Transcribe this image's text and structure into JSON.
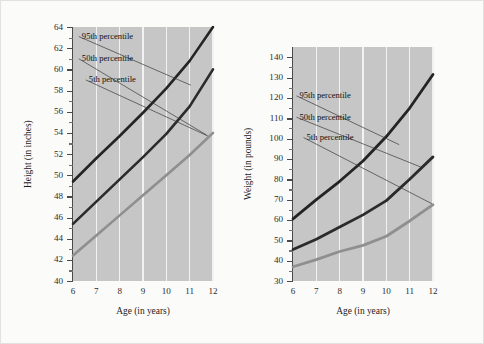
{
  "figure": {
    "background": "#fbfbfa",
    "border_color": "#e2e2e0",
    "plot_background": "#c6c6c6",
    "gridline_color": "#f2f2f2"
  },
  "chart_data": [
    {
      "id": "height",
      "type": "line",
      "title": "",
      "xlabel": "Age (in years)",
      "ylabel": "Height (in inches)",
      "x": [
        6,
        7,
        8,
        9,
        10,
        11,
        12
      ],
      "xlim": [
        6,
        12
      ],
      "ylim": [
        40,
        64
      ],
      "xticks": [
        "6",
        "7",
        "8",
        "9",
        "10",
        "11",
        "12"
      ],
      "yticks": [
        "40",
        "42",
        "44",
        "46",
        "48",
        "50",
        "52",
        "54",
        "56",
        "58",
        "60",
        "62",
        "64"
      ],
      "ytick_step": 2,
      "grid": "vertical",
      "legend": "inline-annotations",
      "series": [
        {
          "name": "95th percentile",
          "color": "#242424",
          "width": 2.6,
          "values": [
            49.4,
            51.6,
            53.7,
            55.9,
            58.2,
            60.8,
            64.0
          ]
        },
        {
          "name": "50th percentile",
          "color": "#2b2b2b",
          "width": 2.6,
          "values": [
            45.4,
            47.5,
            49.6,
            51.7,
            53.9,
            56.5,
            60.0
          ]
        },
        {
          "name": "5th percentile",
          "color": "#8f8f8f",
          "width": 2.6,
          "values": [
            42.4,
            44.3,
            46.2,
            48.1,
            50.0,
            51.9,
            54.0
          ]
        }
      ],
      "annotations": [
        {
          "text": "95th percentile",
          "label_x": 6.25,
          "label_y": 63.1,
          "anchor_x": 11.05,
          "anchor_y": 58.5
        },
        {
          "text": "50th percentile",
          "label_x": 6.25,
          "label_y": 61.0,
          "anchor_x": 11.72,
          "anchor_y": 53.8
        },
        {
          "text": "5th percentile",
          "label_x": 6.55,
          "label_y": 59.0,
          "anchor_x": 11.78,
          "anchor_y": 53.7
        }
      ]
    },
    {
      "id": "weight",
      "type": "line",
      "title": "",
      "xlabel": "Age (in years)",
      "ylabel": "Weight (in pounds)",
      "x": [
        6,
        7,
        8,
        9,
        10,
        11,
        12
      ],
      "xlim": [
        6,
        12
      ],
      "ylim": [
        30,
        145
      ],
      "xticks": [
        "6",
        "7",
        "8",
        "9",
        "10",
        "11",
        "12"
      ],
      "yticks": [
        "30",
        "40",
        "50",
        "60",
        "70",
        "80",
        "90",
        "100",
        "110",
        "120",
        "130",
        "140"
      ],
      "ytick_step": 10,
      "grid": "vertical",
      "legend": "inline-annotations",
      "series": [
        {
          "name": "95th percentile",
          "color": "#242424",
          "width": 2.8,
          "values": [
            60.5,
            70.0,
            79.0,
            89.0,
            101.0,
            115.0,
            131.5
          ]
        },
        {
          "name": "50th percentile",
          "color": "#2b2b2b",
          "width": 2.8,
          "values": [
            45.5,
            50.5,
            56.5,
            62.5,
            69.5,
            80.0,
            91.0
          ]
        },
        {
          "name": "5th percentile",
          "color": "#8f8f8f",
          "width": 2.8,
          "values": [
            37.0,
            40.5,
            44.5,
            47.5,
            52.0,
            59.5,
            67.5
          ]
        }
      ],
      "annotations": [
        {
          "text": "95th percentile",
          "label_x": 6.15,
          "label_y": 121.0,
          "anchor_x": 10.55,
          "anchor_y": 97.0
        },
        {
          "text": "50th percentile",
          "label_x": 6.15,
          "label_y": 110.5,
          "anchor_x": 11.48,
          "anchor_y": 86.0
        },
        {
          "text": "5th percentile",
          "label_x": 6.45,
          "label_y": 100.5,
          "anchor_x": 11.95,
          "anchor_y": 68.0
        }
      ]
    }
  ]
}
